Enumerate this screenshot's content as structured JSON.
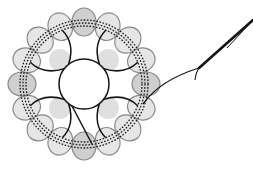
{
  "diagram": {
    "center": {
      "x": 84,
      "y": 84
    },
    "outer_ring": {
      "lobe_count": 16,
      "radius": 62,
      "lobe_rx": 12,
      "lobe_ry": 14,
      "light_fill": "#e6e6e6",
      "dark_fill": "#cfcfcf",
      "stroke": "#8a8a8a",
      "dark_lobe_indices": [
        0,
        4,
        8,
        12
      ]
    },
    "inner_lobes": {
      "count": 4,
      "radius": 34,
      "angles_deg": [
        45,
        135,
        225,
        315
      ],
      "rx": 11,
      "ry": 11,
      "fill": "#d9d9d9"
    },
    "inner_circle": {
      "radius": 25
    },
    "dashed_rings": [
      {
        "radius": 58
      },
      {
        "radius": 61
      },
      {
        "radius": 64
      }
    ],
    "tail": {
      "start": {
        "x": 143,
        "y": 104
      },
      "fork": {
        "x": 199,
        "y": 68
      },
      "hook_end": {
        "x": 195,
        "y": 80
      },
      "end": {
        "x": 253,
        "y": 20
      },
      "color": "#151515"
    },
    "colors": {
      "line": "#151515",
      "background": "#ffffff"
    }
  }
}
